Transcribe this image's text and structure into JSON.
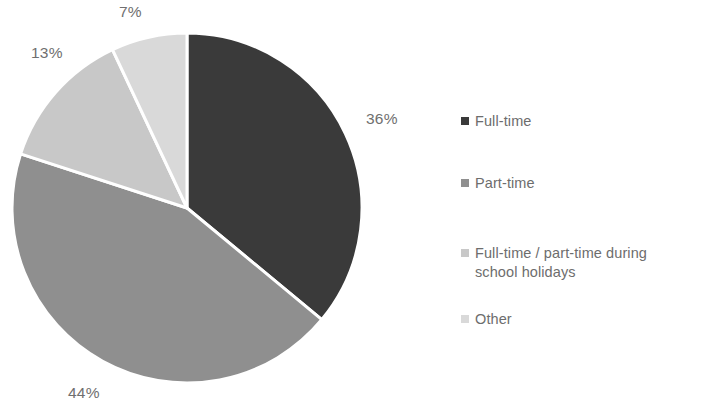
{
  "chart_data": {
    "type": "pie",
    "title": "",
    "subtitle": "",
    "xlabel": "",
    "ylabel": "",
    "legend_position": "right",
    "grid": false,
    "start_angle_deg": 0,
    "direction": "clockwise",
    "categories": [
      "Full-time",
      "Part-time",
      "Full-time / part-time during school holidays",
      "Other"
    ],
    "values": [
      36,
      44,
      13,
      7
    ],
    "value_unit": "%",
    "data_labels": [
      "36%",
      "44%",
      "13%",
      "7%"
    ],
    "colors": [
      "#3a3a3a",
      "#8f8f8f",
      "#c8c8c8",
      "#d9d9d9"
    ],
    "slice_border_color": "#ffffff",
    "slices": [
      {
        "label": "Full-time",
        "value": 36,
        "display": "36%",
        "color": "#3a3a3a"
      },
      {
        "label": "Part-time",
        "value": 44,
        "display": "44%",
        "color": "#8f8f8f"
      },
      {
        "label": "Full-time / part-time during school holidays",
        "value": 13,
        "display": "13%",
        "color": "#c8c8c8"
      },
      {
        "label": "Other",
        "value": 7,
        "display": "7%",
        "color": "#d9d9d9"
      }
    ]
  },
  "labels": {
    "full_time_pct": "36%",
    "part_time_pct": "44%",
    "holidays_pct": "13%",
    "other_pct": "7%"
  },
  "legend": {
    "items": [
      {
        "label": "Full-time",
        "color": "#3a3a3a"
      },
      {
        "label": "Part-time",
        "color": "#8f8f8f"
      },
      {
        "label": "Full-time / part-time during\nschool holidays",
        "color": "#c8c8c8"
      },
      {
        "label": "Other",
        "color": "#d9d9d9"
      }
    ]
  }
}
